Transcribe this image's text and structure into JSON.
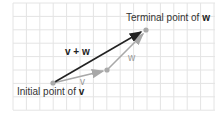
{
  "diagram": {
    "labels": {
      "terminal_prefix": "Terminal point of ",
      "terminal_vec": "w",
      "initial_prefix": "Initial point of ",
      "initial_vec": "v",
      "sum": "v + w",
      "v": "v",
      "w": "w"
    },
    "points": {
      "initial": [
        53,
        83
      ],
      "middle": [
        107,
        70
      ],
      "terminal": [
        146,
        30
      ]
    },
    "colors": {
      "grid": "#e4e4e4",
      "sum": "#222222",
      "vec": "#a8a8a8"
    }
  }
}
